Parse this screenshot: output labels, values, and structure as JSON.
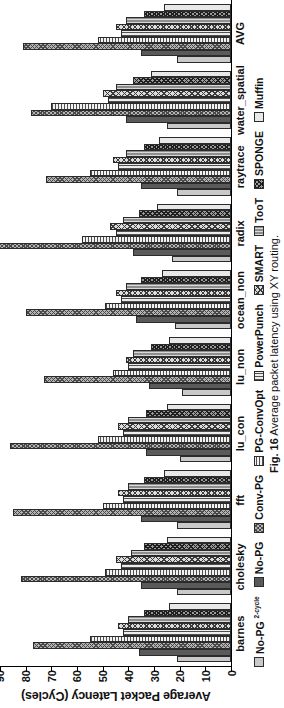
{
  "figure": {
    "caption_label": "Fig. 16",
    "caption_text": "Average packet latency using XY routing."
  },
  "chart_data": {
    "type": "bar",
    "title": "",
    "xlabel": "",
    "ylabel": "Average Packet Latency (Cycles)",
    "ylim": [
      0,
      90
    ],
    "yticks": [
      0,
      10,
      20,
      30,
      40,
      50,
      60,
      70,
      80,
      90
    ],
    "grid": false,
    "legend_position": "bottom",
    "categories": [
      "barnes",
      "cholesky",
      "fft",
      "lu_con",
      "lu_non",
      "ocean_non",
      "radix",
      "raytrace",
      "water_spatial",
      "AVG"
    ],
    "series": [
      {
        "name": "No-PG 2-cycle",
        "pattern": "solid-light-gray",
        "values": [
          21,
          21,
          21,
          20,
          19,
          22,
          23,
          21,
          25,
          21
        ]
      },
      {
        "name": "No-PG",
        "pattern": "solid-dark-gray",
        "values": [
          36,
          35,
          35,
          33,
          32,
          37,
          38,
          35,
          41,
          35
        ]
      },
      {
        "name": "Conv-PG",
        "pattern": "cross-hatch-dense",
        "values": [
          77,
          82,
          85,
          86,
          73,
          80,
          94,
          72,
          78,
          81
        ]
      },
      {
        "name": "PG-ConvOpt",
        "pattern": "horizontal-lines",
        "values": [
          55,
          49,
          50,
          52,
          46,
          49,
          58,
          55,
          70,
          52
        ]
      },
      {
        "name": "PowerPunch",
        "pattern": "vertical-lines",
        "values": [
          42,
          43,
          42,
          42,
          40,
          43,
          45,
          44,
          48,
          43
        ]
      },
      {
        "name": "SMART",
        "pattern": "cross-hatch-light",
        "values": [
          44,
          45,
          44,
          44,
          41,
          45,
          47,
          46,
          50,
          45
        ]
      },
      {
        "name": "TooT",
        "pattern": "dark-vertical",
        "values": [
          40,
          39,
          40,
          40,
          38,
          41,
          42,
          41,
          45,
          41
        ]
      },
      {
        "name": "SPONGE",
        "pattern": "cross-hatch-mid",
        "values": [
          34,
          34,
          34,
          33,
          31,
          35,
          36,
          34,
          38,
          34
        ]
      },
      {
        "name": "Muffin",
        "pattern": "solid-white",
        "values": [
          24,
          25,
          26,
          25,
          24,
          27,
          29,
          28,
          31,
          26
        ]
      }
    ]
  },
  "legend": {
    "items": [
      {
        "label": "No-PG ",
        "sup": "2-cycle"
      },
      {
        "label": "No-PG",
        "sup": ""
      },
      {
        "label": "Conv-PG",
        "sup": ""
      },
      {
        "label": "PG-ConvOpt",
        "sup": ""
      },
      {
        "label": "PowerPunch",
        "sup": ""
      },
      {
        "label": "SMART",
        "sup": ""
      },
      {
        "label": "TooT",
        "sup": ""
      },
      {
        "label": "SPONGE",
        "sup": ""
      },
      {
        "label": "Muffin",
        "sup": ""
      }
    ]
  }
}
